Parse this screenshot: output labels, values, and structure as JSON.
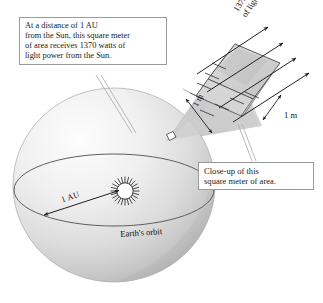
{
  "figure": {
    "type": "diagram",
    "background_color": "#ffffff"
  },
  "callouts": {
    "distance": {
      "name": "distance-callout",
      "lines": [
        "At a distance of 1 AU",
        "from the Sun, this square meter",
        "of area receives 1370 watts of",
        "light power from the Sun."
      ],
      "border_color": "#9a9a9a",
      "background_color": "#ffffff"
    },
    "closeup": {
      "name": "closeup-callout",
      "lines": [
        "Close-up of this",
        "square meter of area."
      ],
      "border_color": "#9a9a9a",
      "background_color": "#ffffff"
    }
  },
  "labels": {
    "light_power_line1": "1370 watts",
    "light_power_line2": "of light power",
    "edge_depth": "1 m",
    "edge_width": "1 m",
    "radius": "1 AU",
    "orbit": "Earth's orbit"
  },
  "sphere": {
    "name": "orbit-sphere",
    "center_x": 114,
    "center_y": 185,
    "radius_x": 101,
    "radius_y": 97,
    "fill_light": "#fbfbfb",
    "fill_mid": "#e2e2e2",
    "fill_dark": "#b9b9b9",
    "outline_color": "#9d9d9d"
  },
  "orbit": {
    "name": "earth-orbit-ellipse",
    "center_x": 114,
    "center_y": 190,
    "radius_x": 100,
    "radius_y": 36,
    "stroke_color": "#5c5c5c"
  },
  "sun": {
    "name": "sun-glyph",
    "center_x": 125,
    "center_y": 191,
    "core_radius": 8,
    "ray_count": 24,
    "ray_length": 6,
    "stroke_color": "#333333"
  },
  "au_arrow": {
    "name": "au-dimension-arrow",
    "x1": 117,
    "y1": 191,
    "x2": 44,
    "y2": 215,
    "stroke_color": "#1f1f1f"
  },
  "wedge": {
    "name": "magnifier-wedge",
    "fill": "#c9c9c9",
    "origin_x": 170,
    "origin_y": 138,
    "origin_size": 7
  },
  "box": {
    "name": "square-meter-box",
    "top_fill": "#cfcfcf",
    "side_fill": "#dedede",
    "front_fill": "#c4c4c4",
    "stroke_color": "#555555"
  },
  "rays": {
    "name": "light-ray-arrows",
    "count": 4,
    "stroke_color": "#222222",
    "direction_degrees": -33
  },
  "colors": {
    "text": "#1a1a1a",
    "line": "#4a4a4a",
    "leader": "#9a9a9a"
  }
}
